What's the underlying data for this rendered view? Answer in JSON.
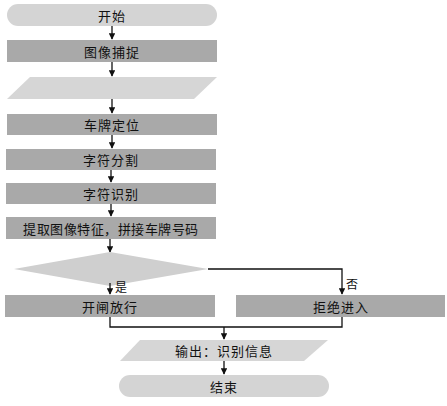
{
  "colors": {
    "process": "#a9a9a9",
    "terminal": "#d4d4d4",
    "io": "#d6d6d6",
    "decision": "#cfcfcf",
    "line": "#111111"
  },
  "nodes": {
    "start": "开始",
    "capture": "图像捕捉",
    "input": "",
    "locate": "车牌定位",
    "segment": "字符分割",
    "recognize": "字符识别",
    "extract": "提取图像特征，拼接车牌号码",
    "decision": "",
    "open": "开闸放行",
    "reject": "拒绝进入",
    "output": "输出：识别信息",
    "end": "结束"
  },
  "branches": {
    "yes": "是",
    "no": "否"
  }
}
